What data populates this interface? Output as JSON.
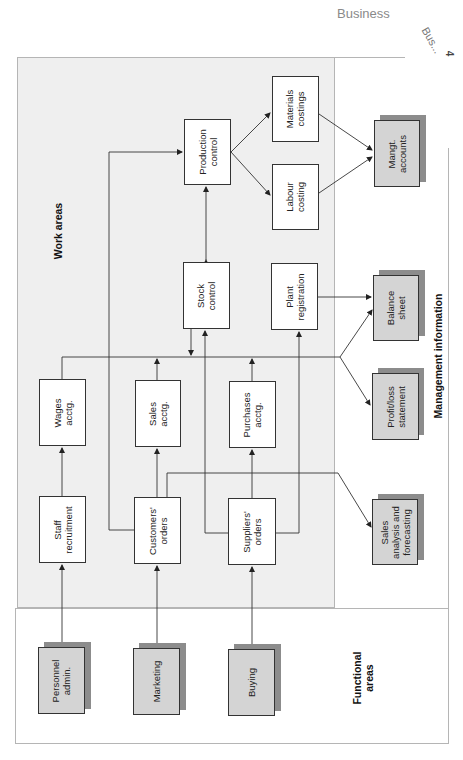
{
  "page": {
    "header": "Business",
    "corner_tab": "Bus...",
    "corner_num": "4"
  },
  "sections": {
    "work_areas": "Work areas",
    "management_information": "Management information",
    "functional_areas": "Functional\nareas"
  },
  "boxes": {
    "production_control": "Production\ncontrol",
    "materials_costings": "Materials\ncostings",
    "labour_costing": "Labour\ncosting",
    "mangt_accounts": "Mangt.\naccounts",
    "stock_control": "Stock\ncontrol",
    "plant_registration": "Plant\nregistration",
    "balance_sheet": "Balance\nsheet",
    "wages_acctg": "Wages\nacctg.",
    "sales_acctg": "Sales\nacctg.",
    "purchases_acctg": "Purchases\nacctg.",
    "profit_loss": "Profit/loss\nstatement",
    "staff_recruitment": "Staff\nrecruitment",
    "customers_orders": "Customers'\norders",
    "suppliers_orders": "Suppliers'\norders",
    "sales_analysis": "Sales\nanalysis and\nforecasting",
    "personnel_admin": "Personnel\nadmin.",
    "marketing": "Marketing",
    "buying": "Buying"
  },
  "colors": {
    "work_area_bg": "#efefef",
    "output_box_bg": "#d4d4d4",
    "shadow": "#8c8c8c",
    "line": "#333333"
  }
}
